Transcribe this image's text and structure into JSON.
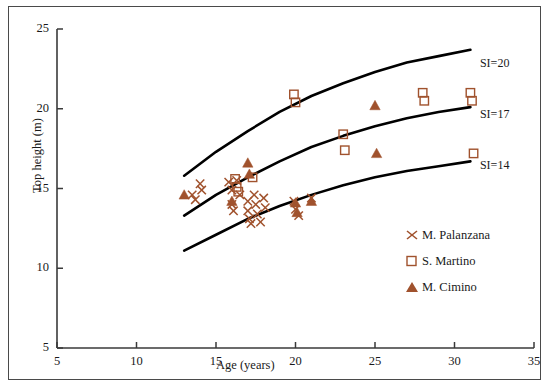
{
  "chart_data": {
    "type": "scatter",
    "title": "",
    "xlabel": "Age (years)",
    "ylabel": "Top height  (m)",
    "xlim": [
      5,
      35
    ],
    "ylim": [
      5,
      25
    ],
    "xticks": [
      5,
      10,
      15,
      20,
      25,
      30,
      35
    ],
    "yticks": [
      5,
      10,
      15,
      20,
      25
    ],
    "grid": false,
    "legend_position": "bottom-right",
    "marker_color": "#a0522d",
    "curve_color": "#000000",
    "axis_color": "#3a3a3a",
    "series": [
      {
        "name": "M. Palanzana",
        "marker": "cross",
        "points": [
          [
            13.5,
            14.6
          ],
          [
            13.7,
            14.3
          ],
          [
            14.0,
            15.3
          ],
          [
            14.1,
            14.9
          ],
          [
            15.8,
            15.4
          ],
          [
            16.0,
            14.9
          ],
          [
            16.0,
            14.0
          ],
          [
            16.1,
            13.6
          ],
          [
            16.3,
            15.5
          ],
          [
            16.5,
            14.6
          ],
          [
            17.0,
            14.2
          ],
          [
            17.0,
            13.6
          ],
          [
            17.1,
            13.1
          ],
          [
            17.2,
            12.8
          ],
          [
            17.4,
            14.6
          ],
          [
            17.5,
            14.0
          ],
          [
            17.6,
            13.4
          ],
          [
            17.8,
            12.9
          ],
          [
            18.0,
            14.4
          ],
          [
            18.1,
            13.8
          ],
          [
            19.9,
            14.2
          ],
          [
            20.0,
            13.7
          ],
          [
            20.2,
            13.3
          ],
          [
            21.0,
            14.4
          ]
        ]
      },
      {
        "name": "S. Martino",
        "marker": "square",
        "points": [
          [
            16.2,
            15.6
          ],
          [
            16.3,
            15.1
          ],
          [
            16.4,
            14.8
          ],
          [
            17.3,
            15.7
          ],
          [
            19.9,
            20.9
          ],
          [
            20.0,
            20.4
          ],
          [
            23.0,
            18.4
          ],
          [
            23.1,
            17.4
          ],
          [
            28.0,
            21.0
          ],
          [
            28.1,
            20.5
          ],
          [
            31.0,
            21.0
          ],
          [
            31.1,
            20.5
          ],
          [
            31.2,
            17.2
          ]
        ]
      },
      {
        "name": "M. Cimino",
        "marker": "triangle",
        "points": [
          [
            13.0,
            14.6
          ],
          [
            16.0,
            14.2
          ],
          [
            17.0,
            16.6
          ],
          [
            17.1,
            15.9
          ],
          [
            20.0,
            14.1
          ],
          [
            20.1,
            13.5
          ],
          [
            21.0,
            14.2
          ],
          [
            25.0,
            20.2
          ],
          [
            25.1,
            17.2
          ]
        ]
      }
    ],
    "curves": [
      {
        "label": "SI=20",
        "label_x": 31.6,
        "label_y": 22.8,
        "points": [
          [
            13,
            15.8
          ],
          [
            15,
            17.3
          ],
          [
            17,
            18.6
          ],
          [
            19,
            19.8
          ],
          [
            21,
            20.8
          ],
          [
            23,
            21.6
          ],
          [
            25,
            22.3
          ],
          [
            27,
            22.9
          ],
          [
            29,
            23.3
          ],
          [
            31,
            23.7
          ]
        ]
      },
      {
        "label": "SI=17",
        "label_x": 31.6,
        "label_y": 19.6,
        "points": [
          [
            13,
            13.3
          ],
          [
            15,
            14.6
          ],
          [
            17,
            15.7
          ],
          [
            19,
            16.7
          ],
          [
            21,
            17.6
          ],
          [
            23,
            18.3
          ],
          [
            25,
            18.9
          ],
          [
            27,
            19.4
          ],
          [
            29,
            19.8
          ],
          [
            31,
            20.1
          ]
        ]
      },
      {
        "label": "SI=14",
        "label_x": 31.6,
        "label_y": 16.4,
        "points": [
          [
            13,
            11.1
          ],
          [
            15,
            12.1
          ],
          [
            17,
            13.1
          ],
          [
            19,
            13.9
          ],
          [
            21,
            14.6
          ],
          [
            23,
            15.2
          ],
          [
            25,
            15.7
          ],
          [
            27,
            16.1
          ],
          [
            29,
            16.4
          ],
          [
            31,
            16.7
          ]
        ]
      }
    ]
  }
}
